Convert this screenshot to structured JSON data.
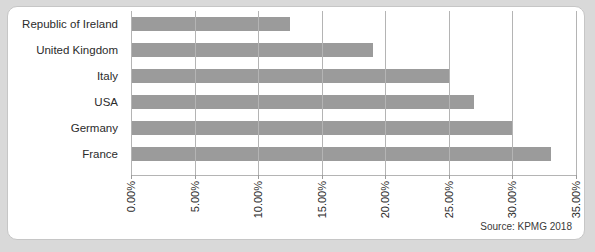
{
  "card": {
    "source_note": "Source: KPMG 2018"
  },
  "colors": {
    "bar": "#9b9b9b",
    "gridline": "#b4b4b4",
    "card_background": "#ffffff",
    "card_border": "#c6c6c6",
    "page_background": "#d9d9d9",
    "text": "#2b2b2b"
  },
  "chart_data": {
    "type": "bar",
    "orientation": "horizontal",
    "title": "",
    "subtitle": "",
    "xlabel": "",
    "ylabel": "",
    "categories": [
      "Republic of Ireland",
      "United Kingdom",
      "Italy",
      "USA",
      "Germany",
      "France"
    ],
    "values": [
      12.5,
      19.0,
      25.0,
      27.0,
      30.0,
      33.0
    ],
    "value_unit": "%",
    "xlim": [
      0,
      35
    ],
    "xticks": [
      0,
      5,
      10,
      15,
      20,
      25,
      30,
      35
    ],
    "xtick_labels": [
      "0.00%",
      "5.00%",
      "10.00%",
      "15.00%",
      "20.00%",
      "25.00%",
      "30.00%",
      "35.00%"
    ],
    "xtick_label_rotation": 90,
    "grid": "vertical",
    "legend": "none",
    "annotations": [
      "Source: KPMG 2018"
    ]
  }
}
